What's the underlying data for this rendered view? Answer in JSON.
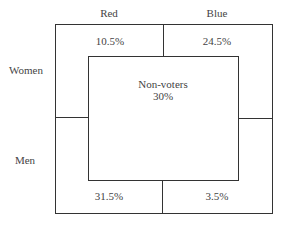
{
  "columns": [
    "Red",
    "Blue"
  ],
  "rows": [
    "Women",
    "Men"
  ],
  "cells": {
    "women_red": "10.5%",
    "women_blue": "24.5%",
    "men_red": "31.5%",
    "men_blue": "3.5%"
  },
  "center": {
    "label": "Non-voters",
    "value": "30%"
  }
}
